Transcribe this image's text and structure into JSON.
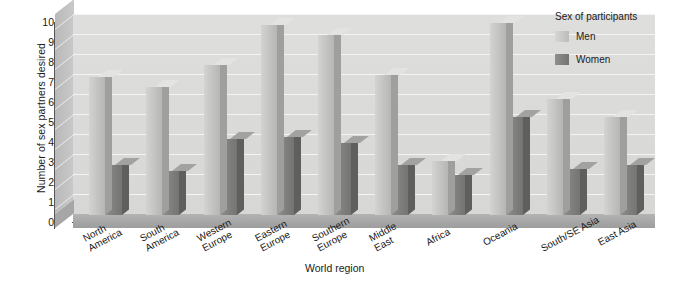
{
  "chart_data": {
    "type": "bar",
    "title": "",
    "xlabel": "World region",
    "ylabel": "Number of sex partners desired",
    "ylim": [
      0,
      10
    ],
    "ytick_labels": [
      "0",
      "1",
      "2",
      "3",
      "4",
      "5",
      "6",
      "7",
      "8",
      "9",
      "10"
    ],
    "grid": true,
    "legend_position": "top-right",
    "legend_title": "Sex of participants",
    "categories": [
      "North America",
      "South America",
      "Western Europe",
      "Eastern Europe",
      "Southern Europe",
      "Middle East",
      "Africa",
      "Oceania",
      "South/SE Asia",
      "East Asia"
    ],
    "series": [
      {
        "name": "Men",
        "color": "#c5c5c4",
        "values": [
          6.9,
          6.4,
          7.5,
          9.5,
          9.0,
          7.0,
          2.7,
          9.6,
          5.8,
          4.9
        ]
      },
      {
        "name": "Women",
        "color": "#7e7e7d",
        "values": [
          2.5,
          2.2,
          3.8,
          3.9,
          3.6,
          2.5,
          2.0,
          4.9,
          2.3,
          2.5
        ]
      }
    ]
  },
  "axes": {
    "y_title": "Number of sex partners desired",
    "x_title": "World region"
  },
  "legend": {
    "title": "Sex of participants",
    "items": [
      {
        "label": "Men"
      },
      {
        "label": "Women"
      }
    ]
  }
}
